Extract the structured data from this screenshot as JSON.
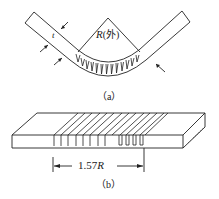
{
  "figure_a": {
    "thickness_label": "t",
    "radius_label": "R",
    "radius_qualifier": "(外)",
    "caption": "（a）",
    "notch_count": 12
  },
  "figure_b": {
    "dimension_label": "1.57R",
    "caption": "（b）",
    "groove_count": 13
  },
  "colors": {
    "line": "#222222",
    "background": "#ffffff"
  }
}
